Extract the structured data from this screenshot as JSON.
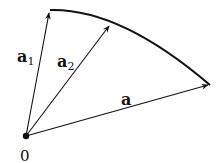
{
  "diagram": {
    "origin_label": "0",
    "vectors": [
      {
        "name": "a1",
        "base": "a",
        "subscript": "1"
      },
      {
        "name": "a2",
        "base": "a",
        "subscript": "2"
      },
      {
        "name": "a",
        "base": "a",
        "subscript": ""
      }
    ],
    "colors": {
      "stroke": "#111111",
      "background": "#ffffff"
    }
  }
}
